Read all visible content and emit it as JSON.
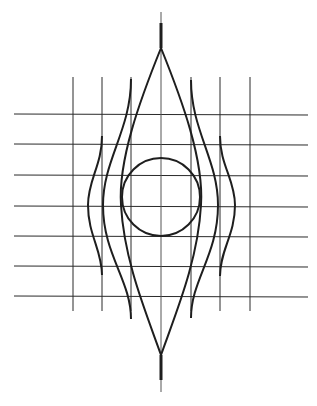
{
  "diagram": {
    "colors": {
      "background": "#ffffff",
      "line": "#1e1e1e",
      "grid": "#2a2a2a"
    },
    "grid": {
      "horizontal_lines_y": [
        114,
        144,
        175,
        206,
        236,
        266,
        296
      ],
      "horizontal_x_range": [
        14,
        308
      ],
      "vertical_lines_x": [
        73,
        102,
        131,
        191,
        220,
        250
      ],
      "vertical_y_range": [
        77,
        311
      ]
    },
    "central_axis": {
      "x": 161,
      "thin_top": 12,
      "thick_top": 23,
      "split_top": 48,
      "split_bottom": 355,
      "thick_bottom": 380,
      "thin_bottom": 392
    },
    "circle": {
      "cx": 161,
      "cy": 197,
      "r": 39
    },
    "curves": [
      {
        "name": "lens-left",
        "d": "M161,48 C140,100 118,160 121,205 C124,260 145,310 161,355"
      },
      {
        "name": "lens-right",
        "d": "M161,48 C182,100 204,160 201,205 C198,260 177,310 161,355"
      },
      {
        "name": "mid-left",
        "d": "M131,79 C131,130 103,160 103,205 C103,255 131,280 131,319"
      },
      {
        "name": "mid-right",
        "d": "M191,80 C191,130 218,160 218,205 C218,255 191,280 191,318"
      },
      {
        "name": "outer-left",
        "d": "M102,136 C102,165 88,180 88,205 C88,235 102,250 102,275"
      },
      {
        "name": "outer-right",
        "d": "M220,136 C220,165 235,180 235,205 C235,235 220,250 220,276"
      }
    ]
  }
}
